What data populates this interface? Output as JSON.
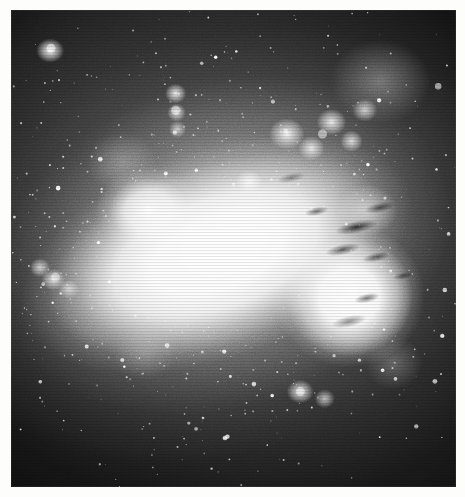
{
  "image": {
    "kind": "astronomical-photographic-plate",
    "subject": "irregular starburst galaxy",
    "band": "greyscale / blue-sensitive emulsion",
    "orientation": "bar runs upper-left to lower-right",
    "alt_text": "Black and white astronomical photograph of an irregular galaxy with a bright saturated central bar, a second bright knot to the right crossed by dark dust lanes, and many resolved star clusters and HII knots on a grainy dark sky background."
  },
  "plate": {
    "border_color": "#fdfdfb",
    "sky_color": "#0d0d0d",
    "core_color": "#ffffff",
    "midtone_color": "#9a9a9a",
    "dust_color": "#000000",
    "frame": {
      "x": 11,
      "y": 10,
      "width": 445,
      "height": 477
    }
  },
  "features": [
    {
      "id": "main-bar",
      "label": "saturated central bar",
      "cx": 47,
      "cy": 50,
      "brightness": 100
    },
    {
      "id": "right-knot",
      "label": "bright western knot",
      "cx": 77,
      "cy": 59,
      "brightness": 98
    },
    {
      "id": "left-lobe",
      "label": "north-east lobe",
      "cx": 31,
      "cy": 42,
      "brightness": 92
    },
    {
      "id": "nw-cluster",
      "label": "compact cluster (upper left)",
      "cx": 9,
      "cy": 8,
      "brightness": 95
    },
    {
      "id": "hii-chain",
      "label": "vertical HII knot chain",
      "cx": 37,
      "cy": 21,
      "brightness": 85
    },
    {
      "id": "hii-group-ne",
      "label": "north-east HII complex",
      "cx": 70,
      "cy": 26,
      "brightness": 90
    },
    {
      "id": "field-star",
      "label": "bright foreground star",
      "cx": 96,
      "cy": 16,
      "brightness": 100
    },
    {
      "id": "south-knot",
      "label": "southern knot",
      "cx": 65,
      "cy": 80,
      "brightness": 88
    },
    {
      "id": "west-clusters",
      "label": "western cluster group",
      "cx": 10,
      "cy": 56,
      "brightness": 80
    },
    {
      "id": "dust-lanes",
      "label": "dust lanes across western knot",
      "cx": 78,
      "cy": 55,
      "brightness": 10
    }
  ],
  "star_field": {
    "count_label": "resolved point sources",
    "seed": 20240517
  }
}
